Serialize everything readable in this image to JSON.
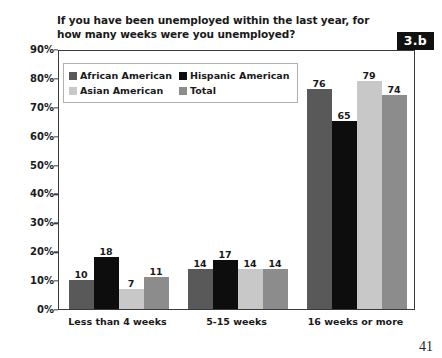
{
  "title": "If you have been unemployed within the last year, for how many weeks were you unemployed?",
  "badge": "3.b",
  "page_number": "41",
  "chart_data": {
    "type": "bar",
    "title": "If you have been unemployed within the last year, for how many weeks were you unemployed?",
    "xlabel": "",
    "ylabel": "",
    "ylim": [
      0,
      90
    ],
    "ytick_labels": [
      "0%",
      "10%",
      "20%",
      "30%",
      "40%",
      "50%",
      "60%",
      "70%",
      "80%",
      "90%"
    ],
    "ytick_values": [
      0,
      10,
      20,
      30,
      40,
      50,
      60,
      70,
      80,
      90
    ],
    "grid": false,
    "legend_position": "top-left",
    "value_labels": true,
    "categories": [
      "Less than 4 weeks",
      "5-15 weeks",
      "16 weeks or more"
    ],
    "series": [
      {
        "name": "African American",
        "color": "#595959",
        "values": [
          10,
          14,
          76
        ]
      },
      {
        "name": "Hispanic American",
        "color": "#0d0d0d",
        "values": [
          18,
          17,
          65
        ]
      },
      {
        "name": "Asian American",
        "color": "#c8c8c8",
        "values": [
          7,
          14,
          79
        ]
      },
      {
        "name": "Total",
        "color": "#8c8c8c",
        "values": [
          11,
          14,
          74
        ]
      }
    ]
  }
}
